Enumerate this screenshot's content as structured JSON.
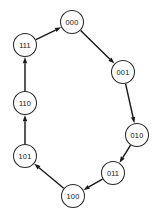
{
  "diagram": {
    "type": "directed-cycle-graph",
    "canvas": {
      "width": 160,
      "height": 219,
      "background": "#ffffff"
    },
    "style": {
      "node_fill": "#ffffff",
      "node_stroke": "#2b2b2b",
      "edge_color": "#1a1a1a",
      "label_color": "#111111",
      "node_radius": 11.5
    },
    "nodes": [
      {
        "id": "000",
        "label": "000",
        "cx": 72,
        "cy": 22
      },
      {
        "id": "001",
        "label": "001",
        "cx": 123,
        "cy": 72
      },
      {
        "id": "010",
        "label": "010",
        "cx": 137,
        "cy": 135
      },
      {
        "id": "011",
        "label": "011",
        "cx": 113,
        "cy": 173
      },
      {
        "id": "100",
        "label": "100",
        "cx": 73,
        "cy": 196
      },
      {
        "id": "101",
        "label": "101",
        "cx": 25,
        "cy": 156
      },
      {
        "id": "110",
        "label": "110",
        "cx": 25,
        "cy": 103
      },
      {
        "id": "111",
        "label": "111",
        "cx": 25,
        "cy": 45
      }
    ],
    "edges": [
      {
        "from": "000",
        "to": "001",
        "directed": true
      },
      {
        "from": "001",
        "to": "010",
        "directed": true
      },
      {
        "from": "010",
        "to": "011",
        "directed": true
      },
      {
        "from": "011",
        "to": "100",
        "directed": true
      },
      {
        "from": "100",
        "to": "101",
        "directed": true
      },
      {
        "from": "101",
        "to": "110",
        "directed": true
      },
      {
        "from": "110",
        "to": "111",
        "directed": true
      },
      {
        "from": "111",
        "to": "000",
        "directed": true
      }
    ]
  }
}
